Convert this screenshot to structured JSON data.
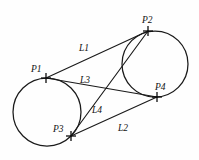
{
  "figure": {
    "background_color": "#fefefe",
    "stroke_color": "#1a1a1a",
    "points": [
      {
        "id": "P1",
        "label": "P1",
        "x": 46,
        "y": 78,
        "label_x": 31,
        "label_y": 72
      },
      {
        "id": "P2",
        "label": "P2",
        "x": 148,
        "y": 31,
        "label_x": 142,
        "label_y": 23
      },
      {
        "id": "P3",
        "label": "P3",
        "x": 71,
        "y": 136,
        "label_x": 53,
        "label_y": 132
      },
      {
        "id": "P4",
        "label": "P4",
        "x": 157,
        "y": 97,
        "label_x": 155,
        "label_y": 90
      }
    ],
    "circles": [
      {
        "id": "left-circle",
        "cx": 47,
        "cy": 112,
        "r": 34
      },
      {
        "id": "right-circle",
        "cx": 155,
        "cy": 64,
        "r": 33
      }
    ],
    "segments": [
      {
        "id": "L1",
        "label": "L1",
        "from": "P1",
        "to": "P2",
        "label_x": 79,
        "label_y": 51
      },
      {
        "id": "L3",
        "label": "L3",
        "from": "P1",
        "to": "P4",
        "label_x": 80,
        "label_y": 83
      },
      {
        "id": "L4",
        "label": "L4",
        "from": "P3",
        "to": "P2",
        "label_x": 92,
        "label_y": 113
      },
      {
        "id": "L2",
        "label": "L2",
        "from": "P3",
        "to": "P4",
        "label_x": 118,
        "label_y": 131
      }
    ],
    "marker_style": {
      "type": "cross",
      "arm_length": 5
    }
  }
}
